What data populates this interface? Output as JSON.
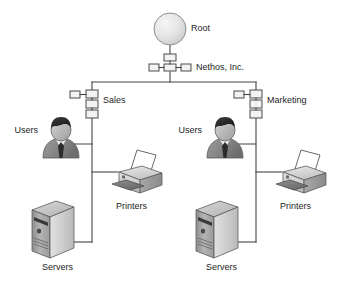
{
  "diagram": {
    "type": "network-tree",
    "background_color": "#ffffff",
    "line_color": "#444444",
    "text_color": "#1d1d1d",
    "nodes": {
      "root": {
        "label": "Root",
        "icon": "circle-root-icon",
        "shape": "circle"
      },
      "organization": {
        "label": "Nethos, Inc.",
        "icon": "organization-container-icon",
        "shape": "box-cluster"
      },
      "sales": {
        "label": "Sales",
        "icon": "organizational-unit-icon",
        "shape": "box-stack"
      },
      "marketing": {
        "label": "Marketing",
        "icon": "organizational-unit-icon",
        "shape": "box-stack"
      }
    },
    "branches": [
      {
        "name": "sales",
        "unit_label": "Sales",
        "leaves": [
          {
            "label": "Users",
            "icon": "user-person-icon",
            "side": "left"
          },
          {
            "label": "Printers",
            "icon": "printer-icon",
            "side": "right"
          },
          {
            "label": "Servers",
            "icon": "server-tower-icon",
            "side": "left"
          }
        ]
      },
      {
        "name": "marketing",
        "unit_label": "Marketing",
        "leaves": [
          {
            "label": "Users",
            "icon": "user-person-icon",
            "side": "left"
          },
          {
            "label": "Printers",
            "icon": "printer-icon",
            "side": "right"
          },
          {
            "label": "Servers",
            "icon": "server-tower-icon",
            "side": "left"
          }
        ]
      }
    ],
    "labels": {
      "root": "Root",
      "organization": "Nethos, Inc.",
      "sales": "Sales",
      "marketing": "Marketing",
      "sales_users": "Users",
      "sales_printers": "Printers",
      "sales_servers": "Servers",
      "marketing_users": "Users",
      "marketing_printers": "Printers",
      "marketing_servers": "Servers"
    },
    "colors": {
      "node_fill": "#f2f2f2",
      "node_stroke": "#4a4a4a",
      "wire": "#444444",
      "hair": "#2b2b2b",
      "tie": "#2b2b2b",
      "body": "#8d8d8d",
      "face": "#bdbdbd",
      "server_front": "#a9a9a9",
      "server_side": "#d2d2d2",
      "printer_body": "#d8d8d8",
      "paper": "#ffffff"
    }
  }
}
